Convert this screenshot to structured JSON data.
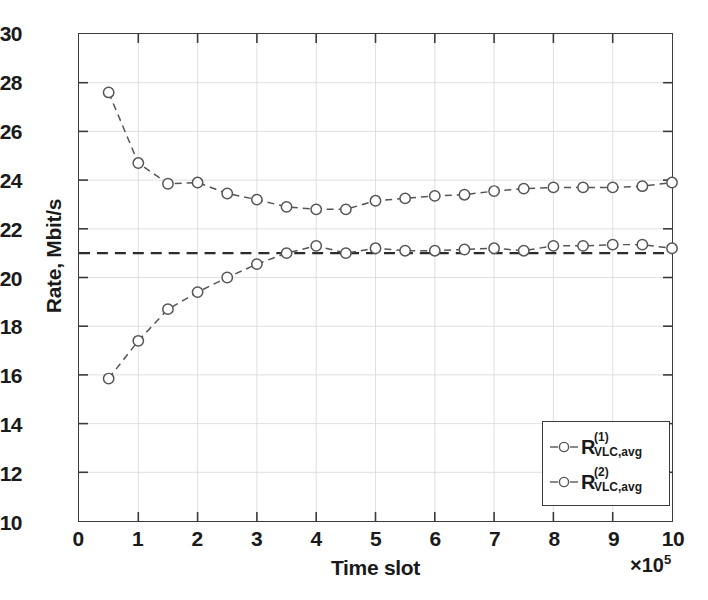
{
  "chart_data": {
    "type": "line",
    "title": "",
    "xlabel": "Time slot",
    "ylabel": "Rate, Mbit/s",
    "x_multiplier": "×10",
    "x_multiplier_exp": "5",
    "xlim": [
      0,
      10
    ],
    "ylim": [
      10,
      30
    ],
    "xticks": [
      "0",
      "1",
      "2",
      "3",
      "4",
      "5",
      "6",
      "7",
      "8",
      "9",
      "10"
    ],
    "yticks": [
      "10",
      "12",
      "14",
      "16",
      "18",
      "20",
      "22",
      "24",
      "26",
      "28",
      "30"
    ],
    "grid": true,
    "legend_position": "lower right",
    "x": [
      0.5,
      1.0,
      1.5,
      2.0,
      2.5,
      3.0,
      3.5,
      4.0,
      4.5,
      5.0,
      5.5,
      6.0,
      6.5,
      7.0,
      7.5,
      8.0,
      8.5,
      9.0,
      9.5,
      10.0
    ],
    "series": [
      {
        "name": "R_VLC,avg^(1)",
        "label_base": "R",
        "label_sup": "(1)",
        "label_sub": "VLC,avg",
        "marker": "circle",
        "linestyle": "dashed",
        "color": "#555555",
        "values": [
          27.6,
          24.7,
          23.85,
          23.9,
          23.45,
          23.2,
          22.9,
          22.8,
          22.8,
          23.15,
          23.25,
          23.35,
          23.4,
          23.55,
          23.65,
          23.7,
          23.7,
          23.7,
          23.75,
          23.9
        ]
      },
      {
        "name": "R_VLC,avg^(2)",
        "label_base": "R",
        "label_sup": "(2)",
        "label_sub": "VLC,avg",
        "marker": "circle",
        "linestyle": "dashed",
        "color": "#555555",
        "values": [
          15.85,
          17.4,
          18.7,
          19.4,
          20.0,
          20.55,
          21.0,
          21.3,
          21.0,
          21.2,
          21.1,
          21.1,
          21.15,
          21.2,
          21.1,
          21.3,
          21.3,
          21.35,
          21.35,
          21.2
        ]
      }
    ],
    "reference_line": {
      "name": "target-rate-reference",
      "y": 21.0,
      "linestyle": "dashed",
      "color": "#2b2b2b"
    }
  },
  "legend": {
    "entries": [
      {
        "base": "R",
        "sup": "(1)",
        "sub": "VLC,avg"
      },
      {
        "base": "R",
        "sup": "(2)",
        "sub": "VLC,avg"
      }
    ]
  }
}
